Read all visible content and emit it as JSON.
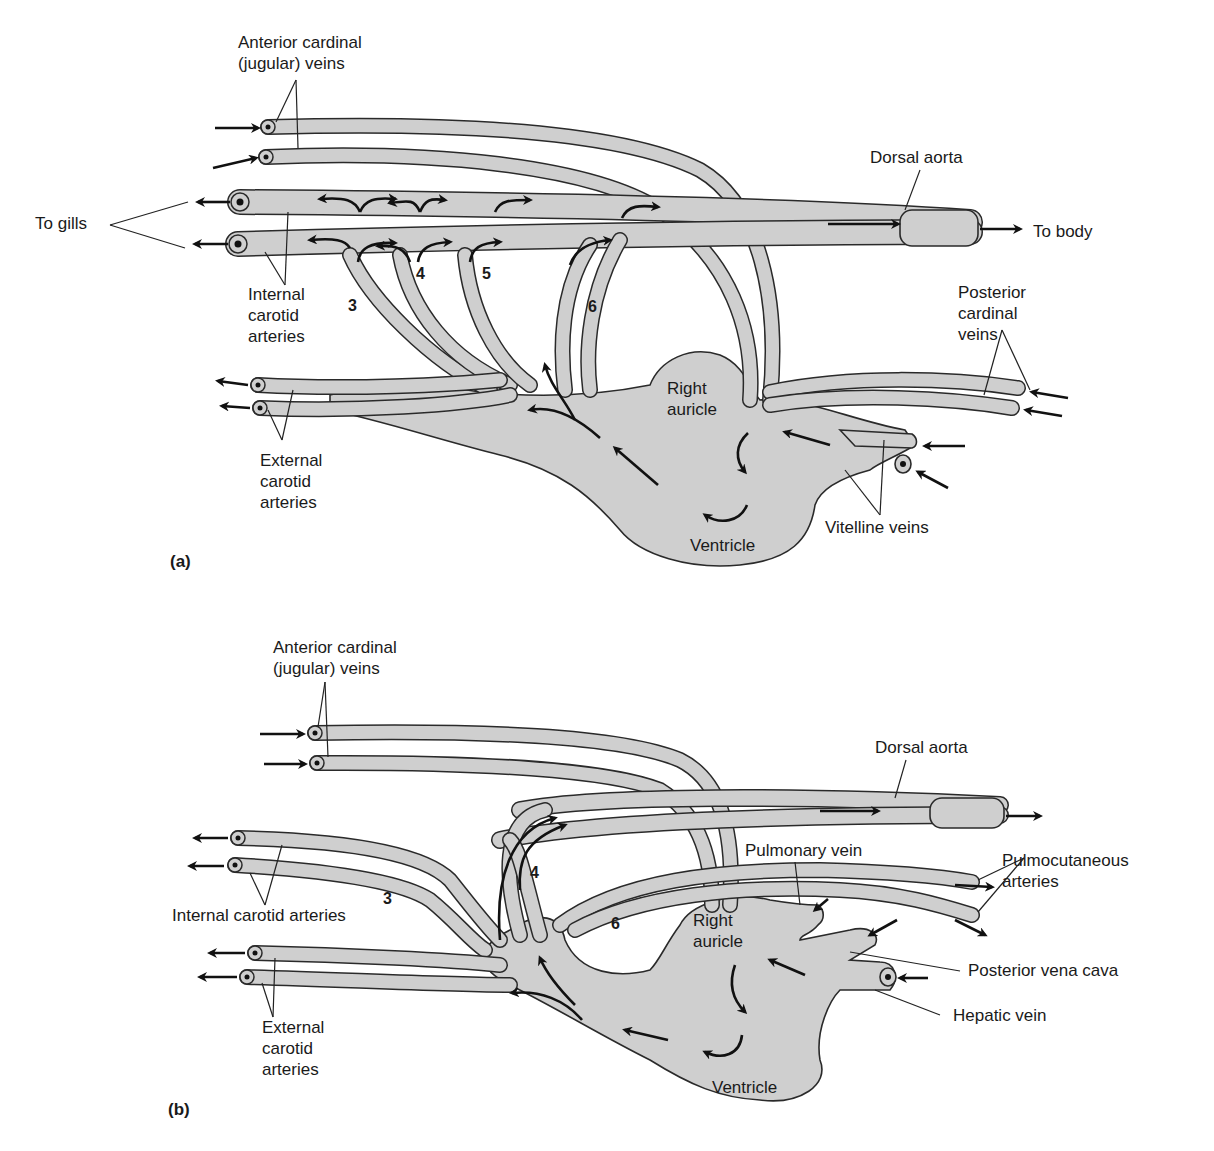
{
  "figure": {
    "panel_a": {
      "tag": "(a)",
      "labels": {
        "anterior_cardinal": [
          "Anterior cardinal",
          "(jugular) veins"
        ],
        "dorsal_aorta": "Dorsal aorta",
        "to_gills": "To gills",
        "to_body": "To body",
        "internal_carotid": [
          "Internal",
          "carotid",
          "arteries"
        ],
        "posterior_cardinal": [
          "Posterior",
          "cardinal",
          "veins"
        ],
        "right_auricle": [
          "Right",
          "auricle"
        ],
        "external_carotid": [
          "External",
          "carotid",
          "arteries"
        ],
        "vitelline_veins": "Vitelline veins",
        "ventricle": "Ventricle"
      },
      "arch_numbers": [
        "3",
        "4",
        "5",
        "6"
      ]
    },
    "panel_b": {
      "tag": "(b)",
      "labels": {
        "anterior_cardinal": [
          "Anterior cardinal",
          "(jugular) veins"
        ],
        "dorsal_aorta": "Dorsal aorta",
        "pulmonary_vein": "Pulmonary vein",
        "pulmocutaneous": [
          "Pulmocutaneous",
          "arteries"
        ],
        "internal_carotid": "Internal carotid arteries",
        "right_auricle": [
          "Right",
          "auricle"
        ],
        "posterior_vena_cava": "Posterior vena cava",
        "hepatic_vein": "Hepatic vein",
        "external_carotid": [
          "External",
          "carotid",
          "arteries"
        ],
        "ventricle": "Ventricle"
      },
      "arch_numbers": [
        "3",
        "4",
        "6"
      ]
    },
    "colors": {
      "vessel_fill": "#cfcfcf",
      "outline": "#2a2a2a",
      "text": "#1a1a1a",
      "background": "#ffffff"
    }
  }
}
